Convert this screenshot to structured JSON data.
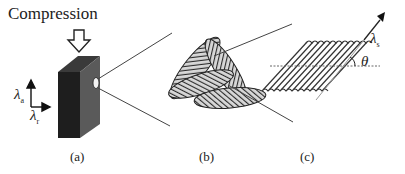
{
  "figure": {
    "title": "Compression",
    "panels": [
      {
        "id": "a",
        "label": "(a)"
      },
      {
        "id": "b",
        "label": "(b)"
      },
      {
        "id": "c",
        "label": "(c)"
      }
    ],
    "axes_a": {
      "vertical": {
        "symbol": "λ",
        "subscript": "a"
      },
      "horizontal": {
        "symbol": "λ",
        "subscript": "r"
      }
    },
    "panel_c": {
      "stretch": {
        "symbol": "λ",
        "subscript": "s"
      },
      "angle": "θ"
    },
    "colors": {
      "block_front": "#1e1e1e",
      "block_side": "#5a5a5a",
      "block_top": "#3a3a3a",
      "line": "#444444",
      "hatch": "#555555"
    }
  }
}
